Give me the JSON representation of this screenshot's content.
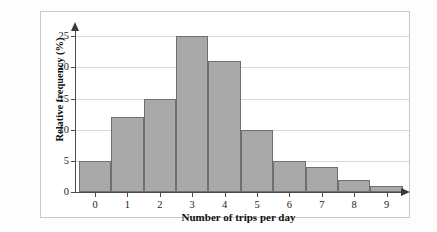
{
  "chart_data": {
    "type": "bar",
    "title": "",
    "subtitle": "",
    "xlabel": "Number of trips per day",
    "ylabel": "Relative frequency (%)",
    "categories": [
      "0",
      "1",
      "2",
      "3",
      "4",
      "5",
      "6",
      "7",
      "8",
      "9"
    ],
    "values": [
      5,
      12,
      15,
      25,
      21,
      10,
      5,
      4,
      2,
      1
    ],
    "yticks": [
      "0",
      "5",
      "10",
      "15",
      "20",
      "25"
    ],
    "ytick_values": [
      0,
      5,
      10,
      15,
      20,
      25
    ],
    "ylim": [
      0,
      26
    ],
    "xlim": [
      -0.5,
      9.5
    ],
    "grid": "horizontal",
    "legend": "none",
    "bar_color": "#a9a9a9",
    "bar_edge_color": "#6f6f6f",
    "gridline_color": "#d8d8d8",
    "axis_color": "#4a4a4a",
    "background_color": "#ffffff",
    "frame_color": "#c9c9c9",
    "annotations": []
  },
  "figure": {
    "x_axis_arrow": "arrow-right-icon",
    "y_axis_arrow": "arrow-up-icon"
  }
}
